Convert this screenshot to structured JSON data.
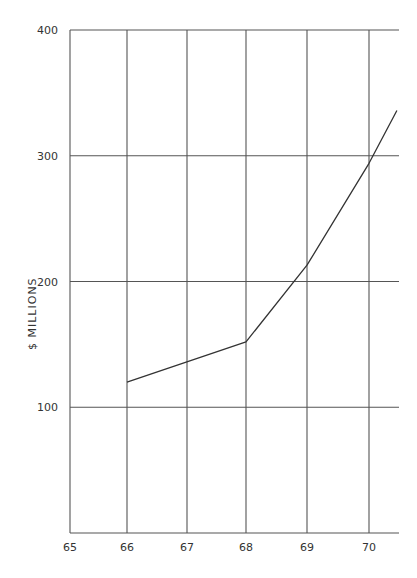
{
  "chart_data": {
    "type": "line",
    "title": "",
    "xlabel": "",
    "ylabel": "$ MILLIONS",
    "x_ticks": [
      "65",
      "66",
      "67",
      "68",
      "69",
      "70"
    ],
    "y_ticks": [
      "100",
      "200",
      "300",
      "400"
    ],
    "ylim": [
      0,
      400
    ],
    "xlim": [
      65,
      70.5
    ],
    "grid": true,
    "series": [
      {
        "name": "",
        "x": [
          66,
          68,
          69,
          70,
          70.45
        ],
        "values": [
          120,
          152,
          213,
          294,
          336
        ]
      }
    ],
    "style": {
      "line_color": "#333333",
      "grid_color": "#555555",
      "hand_drawn": true
    }
  }
}
